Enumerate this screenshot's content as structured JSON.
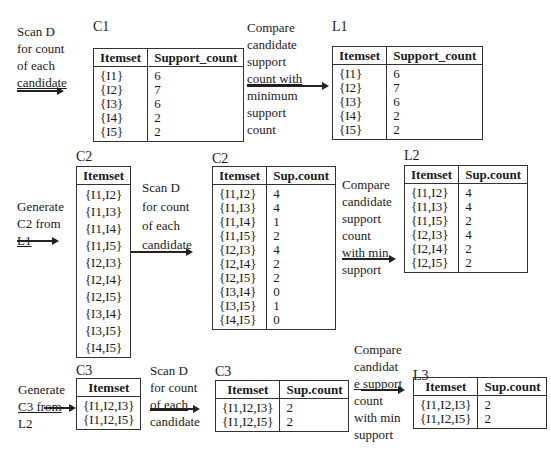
{
  "step1": {
    "scan_note": [
      "Scan D",
      "for count",
      "of each",
      "candidate"
    ],
    "compare_note": [
      "Compare",
      "candidate",
      "support",
      "count with",
      "minimum",
      "support",
      "count"
    ],
    "c1": {
      "label": "C1",
      "headers": [
        "Itemset",
        "Support_count"
      ],
      "rows": [
        [
          "{I1}",
          "6"
        ],
        [
          "{I2}",
          "7"
        ],
        [
          "{I3}",
          "6"
        ],
        [
          "{I4}",
          "2"
        ],
        [
          "{I5}",
          "2"
        ]
      ]
    },
    "l1": {
      "label": "L1",
      "headers": [
        "Itemset",
        "Support_count"
      ],
      "rows": [
        [
          "{I1}",
          "6"
        ],
        [
          "{I2}",
          "7"
        ],
        [
          "{I3}",
          "6"
        ],
        [
          "{I4}",
          "2"
        ],
        [
          "{I5}",
          "2"
        ]
      ]
    }
  },
  "step2": {
    "generate_note": [
      "Generate",
      "C2 from",
      "L1"
    ],
    "scan_note": [
      "Scan D",
      "for count",
      "of each",
      "candidate"
    ],
    "compare_note": [
      "Compare",
      "candidate",
      "support",
      "count",
      "with min",
      "support"
    ],
    "c2_candidates": {
      "label": "C2",
      "headers": [
        "Itemset"
      ],
      "rows": [
        [
          "{I1,I2}"
        ],
        [
          "{I1,I3}"
        ],
        [
          "{I1,I4}"
        ],
        [
          "{I1,I5}"
        ],
        [
          "{I2,I3}"
        ],
        [
          "{I2,I4}"
        ],
        [
          "{I2,I5}"
        ],
        [
          "{I3,I4}"
        ],
        [
          "{I3,I5}"
        ],
        [
          "{I4,I5}"
        ]
      ]
    },
    "c2_counts": {
      "label": "C2",
      "headers": [
        "Itemset",
        "Sup.count"
      ],
      "rows": [
        [
          "{I1,I2}",
          "4"
        ],
        [
          "{I1,I3}",
          "4"
        ],
        [
          "{I1,I4}",
          "1"
        ],
        [
          "{I1,I5}",
          "2"
        ],
        [
          "{I2,I3}",
          "4"
        ],
        [
          "{I2,I4}",
          "2"
        ],
        [
          "{I2,I5}",
          "2"
        ],
        [
          "{I3,I4}",
          "0"
        ],
        [
          "{I3,I5}",
          "1"
        ],
        [
          "{I4,I5}",
          "0"
        ]
      ]
    },
    "l2": {
      "label": "L2",
      "headers": [
        "Itemset",
        "Sup.count"
      ],
      "rows": [
        [
          "{I1,I2}",
          "4"
        ],
        [
          "{I1,I3}",
          "4"
        ],
        [
          "{I1,I5}",
          "2"
        ],
        [
          "{I2,I3}",
          "4"
        ],
        [
          "{I2,I4}",
          "2"
        ],
        [
          "{I2,I5}",
          "2"
        ]
      ]
    }
  },
  "step3": {
    "generate_note": [
      "Generate",
      "C3 from",
      "L2"
    ],
    "scan_note": [
      "Scan D",
      "for count",
      "of each",
      "candidate"
    ],
    "compare_note": [
      "Compare",
      "candidat",
      "e support",
      "count",
      "with min",
      "support"
    ],
    "c3_candidates": {
      "label": "C3",
      "headers": [
        "Itemset"
      ],
      "rows": [
        [
          "{I1,I2,I3}"
        ],
        [
          "{I1,I2,I5}"
        ]
      ]
    },
    "c3_counts": {
      "label": "C3",
      "headers": [
        "Itemset",
        "Sup.count"
      ],
      "rows": [
        [
          "{I1,I2,I3}",
          "2"
        ],
        [
          "{I1,I2,I5}",
          "2"
        ]
      ]
    },
    "l3": {
      "label": "L3",
      "headers": [
        "Itemset",
        "Sup.count"
      ],
      "rows": [
        [
          "{I1,I2,I3}",
          "2"
        ],
        [
          "{I1,I2,I5}",
          "2"
        ]
      ]
    }
  }
}
